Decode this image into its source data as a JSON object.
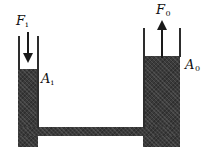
{
  "figure": {
    "name": "hydraulic-connected-vessels-diagram",
    "background_color": "#ffffff",
    "fluid_color": "#3b3b3b",
    "wall_color": "#2d2d2d",
    "arrow_color": "#1a1a1a"
  },
  "labels": {
    "force_input": {
      "symbol": "F",
      "subscript": "i",
      "text": "Fi"
    },
    "force_output": {
      "symbol": "F",
      "subscript": "0",
      "text": "F0"
    },
    "area_input": {
      "symbol": "A",
      "subscript": "i",
      "text": "Ai"
    },
    "area_output": {
      "symbol": "A",
      "subscript": "0",
      "text": "A0"
    }
  },
  "arrows": {
    "input": {
      "name": "force-input-arrow",
      "direction": "down"
    },
    "output": {
      "name": "force-output-arrow",
      "direction": "up"
    }
  },
  "vessel": {
    "left_column": {
      "name": "input-piston-column",
      "width_class": "narrow"
    },
    "right_column": {
      "name": "output-piston-column",
      "width_class": "wide"
    },
    "bottom_channel": {
      "name": "connecting-channel"
    }
  }
}
